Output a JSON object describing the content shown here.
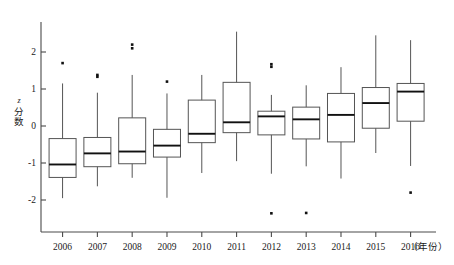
{
  "chart_data": {
    "type": "box",
    "title": "",
    "subtitle": "",
    "xlabel": "年份",
    "xlabel_display": "（年份）",
    "ylabel": "z 分数",
    "ylabel_parts": [
      "z",
      "分",
      "数"
    ],
    "grid": false,
    "legend": "none",
    "ylim": [
      -2.6,
      2.7
    ],
    "yticks": [
      2,
      1,
      0,
      -1,
      -2
    ],
    "ytick_labels": [
      "2",
      "1",
      "0",
      "-1",
      "-2"
    ],
    "categories": [
      "2006",
      "2007",
      "2008",
      "2009",
      "2010",
      "2011",
      "2012",
      "2013",
      "2014",
      "2015",
      "2016"
    ],
    "boxes": [
      {
        "category": "2006",
        "whisker_low": -1.95,
        "q1": -1.39,
        "median": -1.04,
        "q3": -0.34,
        "whisker_high": 1.15,
        "outliers": [
          1.7
        ]
      },
      {
        "category": "2007",
        "whisker_low": -1.63,
        "q1": -1.1,
        "median": -0.74,
        "q3": -0.31,
        "whisker_high": 0.9,
        "outliers": [
          1.33,
          1.38
        ]
      },
      {
        "category": "2008",
        "whisker_low": -1.4,
        "q1": -1.02,
        "median": -0.69,
        "q3": 0.22,
        "whisker_high": 1.38,
        "outliers": [
          2.1,
          2.2
        ]
      },
      {
        "category": "2009",
        "whisker_low": -1.94,
        "q1": -0.84,
        "median": -0.53,
        "q3": -0.09,
        "whisker_high": 0.88,
        "outliers": [
          1.2
        ]
      },
      {
        "category": "2010",
        "whisker_low": -1.27,
        "q1": -0.45,
        "median": -0.21,
        "q3": 0.7,
        "whisker_high": 1.38,
        "outliers": []
      },
      {
        "category": "2011",
        "whisker_low": -0.95,
        "q1": -0.18,
        "median": 0.1,
        "q3": 1.18,
        "whisker_high": 2.55,
        "outliers": []
      },
      {
        "category": "2012",
        "whisker_low": -1.29,
        "q1": -0.24,
        "median": 0.26,
        "q3": 0.4,
        "whisker_high": 0.84,
        "outliers": [
          1.6,
          1.67,
          -2.36
        ]
      },
      {
        "category": "2013",
        "whisker_low": -1.09,
        "q1": -0.35,
        "median": 0.18,
        "q3": 0.51,
        "whisker_high": 1.1,
        "outliers": [
          -2.35
        ]
      },
      {
        "category": "2014",
        "whisker_low": -1.42,
        "q1": -0.43,
        "median": 0.3,
        "q3": 0.88,
        "whisker_high": 1.59,
        "outliers": []
      },
      {
        "category": "2015",
        "whisker_low": -0.73,
        "q1": -0.06,
        "median": 0.62,
        "q3": 1.04,
        "whisker_high": 2.45,
        "outliers": []
      },
      {
        "category": "2016",
        "whisker_low": -1.08,
        "q1": 0.13,
        "median": 0.93,
        "q3": 1.15,
        "whisker_high": 2.32,
        "outliers": [
          -1.8
        ]
      }
    ]
  },
  "colors": {
    "axis": "#4a4a4a",
    "box_stroke": "#555555",
    "median": "#111111",
    "outlier": "#111111",
    "background": "#ffffff"
  }
}
